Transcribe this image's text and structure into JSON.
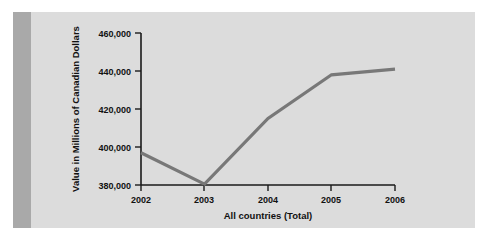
{
  "chart_data": {
    "type": "line",
    "title": "",
    "subtitle": "",
    "xlabel": "All countries (Total)",
    "ylabel": "Value in Millions of Canadian Dollars",
    "categories": [
      "2002",
      "2003",
      "2004",
      "2005",
      "2006"
    ],
    "x": [
      2002,
      2003,
      2004,
      2005,
      2006
    ],
    "values": [
      397000,
      380500,
      415000,
      438000,
      441000
    ],
    "series": [
      {
        "name": "All countries (Total)",
        "values": [
          397000,
          380500,
          415000,
          438000,
          441000
        ]
      }
    ],
    "ylim": [
      380000,
      460000
    ],
    "y_ticks": [
      380000,
      400000,
      420000,
      440000,
      460000
    ],
    "y_tick_labels": [
      "380,000",
      "400,000",
      "420,000",
      "440,000",
      "460,000"
    ],
    "x_ticks": [
      2002,
      2003,
      2004,
      2005,
      2006
    ],
    "x_tick_labels": [
      "2002",
      "2003",
      "2004",
      "2005",
      "2006"
    ],
    "grid": false,
    "legend": false,
    "legend_position": "none",
    "line_color": "#787878",
    "axis_color": "#1a1a1a",
    "background_color": "#dcdcdc",
    "annotations": []
  },
  "figure": {
    "page_background": "#dcdcdc",
    "binding_band_color": "#a9a9a9",
    "y_axis_title": "Value in Millions of Canadian Dollars",
    "x_axis_title": "All countries (Total)",
    "y_labels": {
      "t0": "380,000",
      "t1": "400,000",
      "t2": "420,000",
      "t3": "440,000",
      "t4": "460,000"
    },
    "x_labels": {
      "t0": "2002",
      "t1": "2003",
      "t2": "2004",
      "t3": "2005",
      "t4": "2006"
    }
  }
}
